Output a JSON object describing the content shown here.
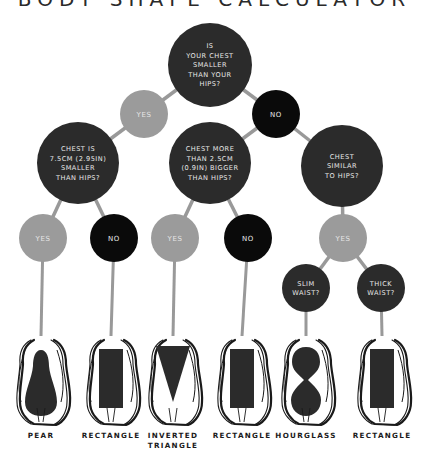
{
  "title": "BODY SHAPE CALCULATOR",
  "colors": {
    "question": "#2b2b2b",
    "yes": "#9b9b9b",
    "no": "#0a0a0a",
    "connector": "#999999",
    "text_light": "#e8e8e8",
    "label": "#1a1a1a"
  },
  "nodes": {
    "q_root": {
      "lines": [
        "IS",
        "YOUR CHEST",
        "SMALLER",
        "THAN YOUR",
        "HIPS?"
      ]
    },
    "a_root_yes": {
      "label": "YES"
    },
    "a_root_no": {
      "label": "NO"
    },
    "q_left": {
      "lines": [
        "CHEST IS",
        "7.5CM (2.95IN)",
        "SMALLER",
        "THAN HIPS?"
      ]
    },
    "q_mid": {
      "lines": [
        "CHEST MORE",
        "THAN 2.5CM",
        "(0.9IN) BIGGER",
        "THAN HIPS?"
      ]
    },
    "q_right": {
      "lines": [
        "CHEST",
        "SIMILAR",
        "TO HIPS?"
      ]
    },
    "a_left_yes": {
      "label": "YES"
    },
    "a_left_no": {
      "label": "NO"
    },
    "a_mid_yes": {
      "label": "YES"
    },
    "a_mid_no": {
      "label": "NO"
    },
    "a_right_yes": {
      "label": "YES"
    },
    "q_slim": {
      "lines": [
        "SLIM",
        "WAIST?"
      ]
    },
    "q_thick": {
      "lines": [
        "THICK",
        "WAIST?"
      ]
    }
  },
  "results": [
    {
      "shape": "pear",
      "label": "PEAR",
      "label_line2": ""
    },
    {
      "shape": "rectangle",
      "label": "RECTANGLE",
      "label_line2": ""
    },
    {
      "shape": "inverted-triangle",
      "label": "INVERTED",
      "label_line2": "TRIANGLE"
    },
    {
      "shape": "rectangle",
      "label": "RECTANGLE",
      "label_line2": ""
    },
    {
      "shape": "hourglass",
      "label": "HOURGLASS",
      "label_line2": ""
    },
    {
      "shape": "rectangle",
      "label": "RECTANGLE",
      "label_line2": ""
    }
  ]
}
